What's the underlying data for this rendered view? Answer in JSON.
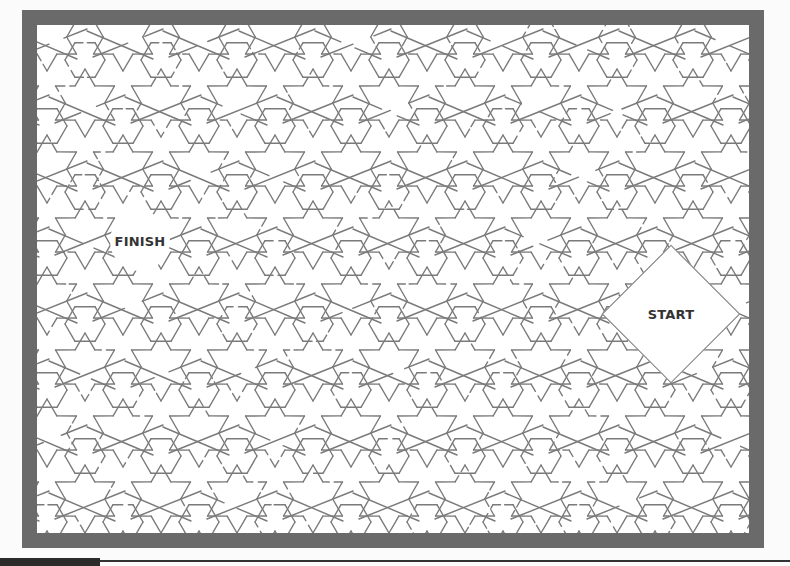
{
  "puzzle": {
    "type": "maze",
    "style": "islamic-geometric-star-pattern",
    "start_label": "START",
    "finish_label": "FINISH",
    "start_position": {
      "x": 671,
      "y": 314
    },
    "finish_position": {
      "x": 140,
      "y": 241
    }
  },
  "colors": {
    "frame": "#6a6a6a",
    "background": "#ffffff",
    "lines": "#7a7a7a",
    "label_text": "#333333",
    "bottom_bar": "#2b2b2b"
  }
}
